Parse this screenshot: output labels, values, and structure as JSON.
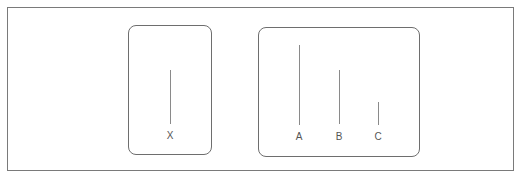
{
  "diagram": {
    "groups": [
      {
        "id": "group-1",
        "items": [
          {
            "label": "X"
          }
        ]
      },
      {
        "id": "group-2",
        "items": [
          {
            "label": "A"
          },
          {
            "label": "B"
          },
          {
            "label": "C"
          }
        ]
      }
    ]
  },
  "colors": {
    "frame": "#7a7a7a",
    "box": "#6e6e6e",
    "line": "#8a8a8a",
    "text": "#555555"
  }
}
